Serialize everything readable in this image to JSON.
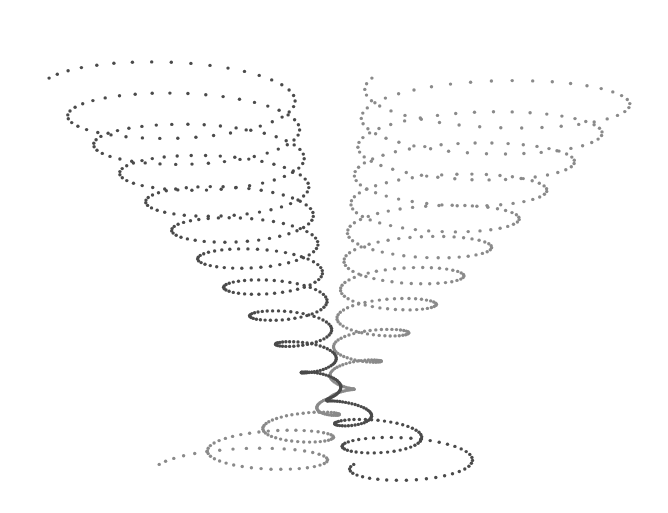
{
  "chart_data": {
    "type": "scatter",
    "title": "",
    "xlabel": "",
    "ylabel": "",
    "grid": false,
    "legend": null,
    "series": [
      {
        "name": "dark-spiral",
        "color": "#4a4a4a",
        "dot_radius": 1.7,
        "turns": 14,
        "points": 560,
        "start_point": [
          112,
          46
        ],
        "end_point": [
          430,
          487
        ],
        "top_center": [
          168,
          88
        ],
        "top_radius_x": 125,
        "top_radius_y": 32,
        "bottom_center": [
          425,
          470
        ],
        "bottom_radius_x": 75,
        "bottom_radius_y": 18,
        "waist_center": [
          335,
          400
        ],
        "waist_t": 0.78
      },
      {
        "name": "light-spiral",
        "color": "#8a8a8a",
        "dot_radius": 1.7,
        "turns": 14,
        "points": 560,
        "start_point": [
          568,
          46
        ],
        "end_point": [
          150,
          487
        ],
        "top_center": [
          505,
          88
        ],
        "top_radius_x": 140,
        "top_radius_y": 32,
        "bottom_center": [
          240,
          470
        ],
        "bottom_radius_x": 85,
        "bottom_radius_y": 18,
        "waist_center": [
          335,
          400
        ],
        "waist_t": 0.78
      }
    ]
  },
  "caption": ""
}
